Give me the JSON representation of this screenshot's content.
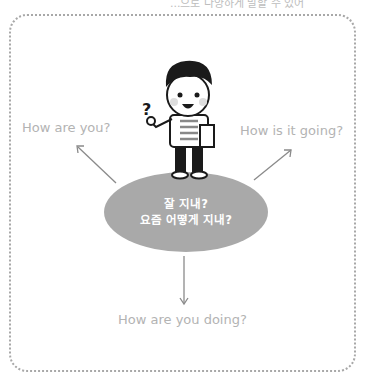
{
  "top_partial_text": "...으로 다양하게 말할 수 있어",
  "labels": {
    "left": "How are you?",
    "right": "How is it going?",
    "bottom": "How are you doing?"
  },
  "bubble": {
    "line1": "잘 지내?",
    "line2": "요즘 어떻게 지내?"
  },
  "colors": {
    "bubble": "#a9a9a9",
    "label_text": "#b3b3b3",
    "arrow": "#8a8a8a",
    "frame": "#a8a8a8"
  },
  "character": {
    "icon": "thinking-boy-icon",
    "symbol": "?"
  }
}
